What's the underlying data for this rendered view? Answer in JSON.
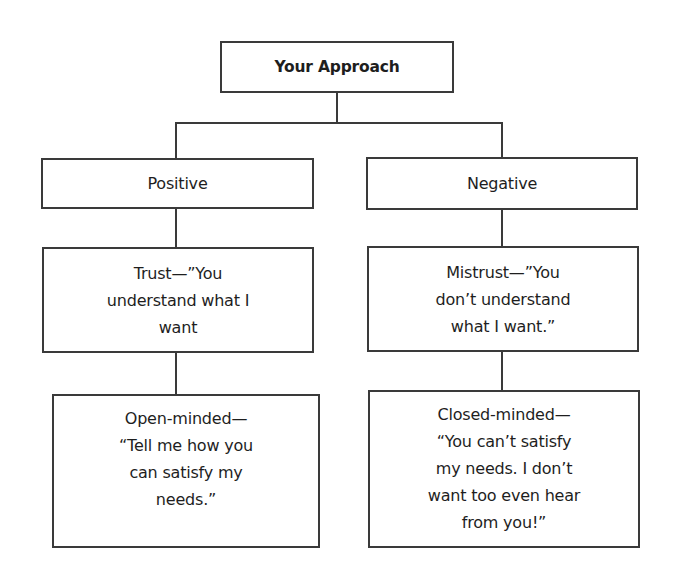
{
  "diagram": {
    "type": "tree",
    "root": {
      "label": "Your Approach"
    },
    "branches": [
      {
        "id": "positive",
        "label": "Positive",
        "nodes": [
          {
            "label": "Trust—”You\nunderstand what I\nwant"
          },
          {
            "label": "Open-minded—\n“Tell me how you\ncan satisfy my\nneeds.”"
          }
        ]
      },
      {
        "id": "negative",
        "label": "Negative",
        "nodes": [
          {
            "label": "Mistrust—”You\ndon’t understand\nwhat I want.”"
          },
          {
            "label": "Closed-minded—\n“You can’t satisfy\nmy needs. I don’t\nwant too even hear\nfrom you!”"
          }
        ]
      }
    ],
    "colors": {
      "stroke": "#3a3a3a",
      "text": "#1e1e1e",
      "background": "#ffffff"
    }
  }
}
